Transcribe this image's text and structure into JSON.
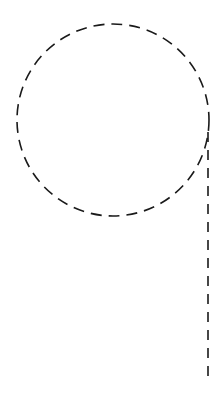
{
  "diagram": {
    "stroke_color": "#1a1a1a",
    "background": "#ffffff",
    "shapes": [
      {
        "type": "dashed-circle",
        "cx": 113,
        "cy": 120,
        "r": 96
      },
      {
        "type": "dashed-line",
        "x1": 208,
        "y1": 132,
        "x2": 208,
        "y2": 380
      }
    ]
  }
}
